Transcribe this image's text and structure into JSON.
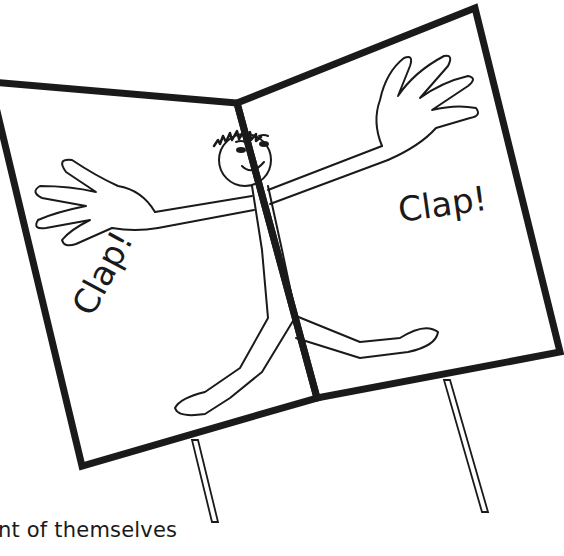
{
  "illustration": {
    "subject": "stick figure on open two-panel card mounted on sticks",
    "left_panel_text": "Clap!",
    "right_panel_text": "Clap!",
    "stroke_color": "#1a1a1a",
    "background_color": "#ffffff"
  },
  "caption": {
    "text": "nt of themselves"
  }
}
